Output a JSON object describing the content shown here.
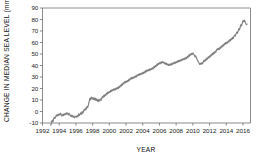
{
  "chart_data": {
    "type": "line",
    "title": "",
    "xlabel": "YEAR",
    "ylabel": "CHANGE IN MEDIAN  SEA LEVEL (mm)",
    "xlim": [
      1992,
      2016.9
    ],
    "ylim": [
      -10,
      90
    ],
    "xticks": [
      1992,
      1994,
      1996,
      1998,
      2000,
      2002,
      2004,
      2006,
      2008,
      2010,
      2012,
      2014,
      2016
    ],
    "xtick_labels": [
      "1992",
      "1994",
      "1996",
      "1998",
      "2000",
      "2002",
      "2004",
      "2006",
      "2008",
      "2010",
      "2012",
      "2014",
      "2016"
    ],
    "yticks": [
      -10,
      0,
      10,
      20,
      30,
      40,
      50,
      60,
      70,
      80,
      90
    ],
    "ytick_labels": [
      "-10",
      "0",
      "10",
      "20",
      "30",
      "40",
      "50",
      "60",
      "70",
      "80",
      "90"
    ],
    "grid": false,
    "legend": null,
    "line_color": "#7f7f7f",
    "series": [
      {
        "name": "Change in median sea level",
        "x": [
          1993.0,
          1993.08,
          1993.17,
          1993.25,
          1993.33,
          1993.42,
          1993.5,
          1993.58,
          1993.67,
          1993.75,
          1993.83,
          1993.92,
          1994.0,
          1994.08,
          1994.17,
          1994.25,
          1994.33,
          1994.42,
          1994.5,
          1994.58,
          1994.67,
          1994.75,
          1994.83,
          1994.92,
          1995.0,
          1995.08,
          1995.17,
          1995.25,
          1995.33,
          1995.42,
          1995.5,
          1995.58,
          1995.67,
          1995.75,
          1995.83,
          1995.92,
          1996.0,
          1996.08,
          1996.17,
          1996.25,
          1996.33,
          1996.42,
          1996.5,
          1996.58,
          1996.67,
          1996.75,
          1996.83,
          1996.92,
          1997.0,
          1997.08,
          1997.17,
          1997.25,
          1997.33,
          1997.42,
          1997.5,
          1997.58,
          1997.67,
          1997.75,
          1997.83,
          1997.92,
          1998.0,
          1998.08,
          1998.17,
          1998.25,
          1998.33,
          1998.42,
          1998.5,
          1998.58,
          1998.67,
          1998.75,
          1998.83,
          1998.92,
          1999.0,
          1999.08,
          1999.17,
          1999.25,
          1999.33,
          1999.42,
          1999.5,
          1999.58,
          1999.67,
          1999.75,
          1999.83,
          1999.92,
          2000.0,
          2000.08,
          2000.17,
          2000.25,
          2000.33,
          2000.42,
          2000.5,
          2000.58,
          2000.67,
          2000.75,
          2000.83,
          2000.92,
          2001.0,
          2001.08,
          2001.17,
          2001.25,
          2001.33,
          2001.42,
          2001.5,
          2001.58,
          2001.67,
          2001.75,
          2001.83,
          2001.92,
          2002.0,
          2002.08,
          2002.17,
          2002.25,
          2002.33,
          2002.42,
          2002.5,
          2002.58,
          2002.67,
          2002.75,
          2002.83,
          2002.92,
          2003.0,
          2003.08,
          2003.17,
          2003.25,
          2003.33,
          2003.42,
          2003.5,
          2003.58,
          2003.67,
          2003.75,
          2003.83,
          2003.92,
          2004.0,
          2004.08,
          2004.17,
          2004.25,
          2004.33,
          2004.42,
          2004.5,
          2004.58,
          2004.67,
          2004.75,
          2004.83,
          2004.92,
          2005.0,
          2005.08,
          2005.17,
          2005.25,
          2005.33,
          2005.42,
          2005.5,
          2005.58,
          2005.67,
          2005.75,
          2005.83,
          2005.92,
          2006.0,
          2006.08,
          2006.17,
          2006.25,
          2006.33,
          2006.42,
          2006.5,
          2006.58,
          2006.67,
          2006.75,
          2006.83,
          2006.92,
          2007.0,
          2007.08,
          2007.17,
          2007.25,
          2007.33,
          2007.42,
          2007.5,
          2007.58,
          2007.67,
          2007.75,
          2007.83,
          2007.92,
          2008.0,
          2008.08,
          2008.17,
          2008.25,
          2008.33,
          2008.42,
          2008.5,
          2008.58,
          2008.67,
          2008.75,
          2008.83,
          2008.92,
          2009.0,
          2009.08,
          2009.17,
          2009.25,
          2009.33,
          2009.42,
          2009.5,
          2009.58,
          2009.67,
          2009.75,
          2009.83,
          2009.92,
          2010.0,
          2010.08,
          2010.17,
          2010.25,
          2010.33,
          2010.42,
          2010.5,
          2010.58,
          2010.67,
          2010.75,
          2010.83,
          2010.92,
          2011.0,
          2011.08,
          2011.17,
          2011.25,
          2011.33,
          2011.42,
          2011.5,
          2011.58,
          2011.67,
          2011.75,
          2011.83,
          2011.92,
          2012.0,
          2012.08,
          2012.17,
          2012.25,
          2012.33,
          2012.42,
          2012.5,
          2012.58,
          2012.67,
          2012.75,
          2012.83,
          2012.92,
          2013.0,
          2013.08,
          2013.17,
          2013.25,
          2013.33,
          2013.42,
          2013.5,
          2013.58,
          2013.67,
          2013.75,
          2013.83,
          2013.92,
          2014.0,
          2014.08,
          2014.17,
          2014.25,
          2014.33,
          2014.42,
          2014.5,
          2014.58,
          2014.67,
          2014.75,
          2014.83,
          2014.92,
          2015.0,
          2015.08,
          2015.17,
          2015.25,
          2015.33,
          2015.42,
          2015.5,
          2015.58,
          2015.67,
          2015.75,
          2015.83,
          2015.92,
          2016.0,
          2016.08,
          2016.17,
          2016.25,
          2016.33,
          2016.42,
          2016.5
        ],
        "y": [
          -12.0,
          -9.0,
          -7.5,
          -9.0,
          -6.5,
          -5.0,
          -6.0,
          -4.5,
          -3.0,
          -4.0,
          -2.5,
          -3.5,
          -2.0,
          -3.0,
          -1.5,
          -3.0,
          -4.0,
          -2.5,
          -3.5,
          -2.0,
          -3.0,
          -1.5,
          -2.5,
          -1.0,
          -2.0,
          -3.0,
          -1.5,
          -2.5,
          -4.0,
          -3.0,
          -4.5,
          -3.5,
          -5.0,
          -4.0,
          -5.5,
          -4.5,
          -4.0,
          -5.0,
          -3.5,
          -4.5,
          -2.0,
          -3.5,
          -2.5,
          -1.0,
          -2.5,
          0.0,
          -1.5,
          0.5,
          2.0,
          1.0,
          3.0,
          2.0,
          4.5,
          3.5,
          6.0,
          8.5,
          11.5,
          10.0,
          12.5,
          11.0,
          12.0,
          10.5,
          12.0,
          10.0,
          11.5,
          9.5,
          11.0,
          9.0,
          10.5,
          8.5,
          10.0,
          11.0,
          9.5,
          11.0,
          13.0,
          12.0,
          14.0,
          13.0,
          15.0,
          14.0,
          16.0,
          15.0,
          17.0,
          16.0,
          17.5,
          16.5,
          18.5,
          17.5,
          19.0,
          18.0,
          19.5,
          18.5,
          20.0,
          19.0,
          20.5,
          19.5,
          21.0,
          20.0,
          22.0,
          21.0,
          23.0,
          22.0,
          24.0,
          23.0,
          25.0,
          24.0,
          26.0,
          25.0,
          26.5,
          25.5,
          27.0,
          26.0,
          28.0,
          27.0,
          29.0,
          28.0,
          29.5,
          28.5,
          30.0,
          29.0,
          30.5,
          29.5,
          31.0,
          30.0,
          32.0,
          31.0,
          32.5,
          31.5,
          33.0,
          32.0,
          33.5,
          32.5,
          34.0,
          33.0,
          34.5,
          33.5,
          35.5,
          34.5,
          36.0,
          35.0,
          36.5,
          35.5,
          37.0,
          36.0,
          37.5,
          36.5,
          38.0,
          37.0,
          39.0,
          38.0,
          40.0,
          39.0,
          41.0,
          40.0,
          42.0,
          41.0,
          42.5,
          41.5,
          43.0,
          42.0,
          43.5,
          42.5,
          43.0,
          41.5,
          42.5,
          41.0,
          42.0,
          40.5,
          41.5,
          40.0,
          41.0,
          40.0,
          41.5,
          40.5,
          42.0,
          41.0,
          42.5,
          41.5,
          43.0,
          42.0,
          43.5,
          42.5,
          44.0,
          43.0,
          44.5,
          43.5,
          45.0,
          44.0,
          45.5,
          44.5,
          46.0,
          45.0,
          46.5,
          45.5,
          47.0,
          46.0,
          48.0,
          47.0,
          49.0,
          48.0,
          50.0,
          49.0,
          50.5,
          49.5,
          51.0,
          50.0,
          49.0,
          47.5,
          48.5,
          47.0,
          45.5,
          44.0,
          43.0,
          42.0,
          41.0,
          42.0,
          41.0,
          42.5,
          41.5,
          43.0,
          44.5,
          43.5,
          45.5,
          44.5,
          46.5,
          45.5,
          47.5,
          46.5,
          48.5,
          47.5,
          49.5,
          48.5,
          50.5,
          49.5,
          51.5,
          50.5,
          52.5,
          51.5,
          53.5,
          54.5,
          53.5,
          55.0,
          54.0,
          56.0,
          55.0,
          57.0,
          56.0,
          58.0,
          57.0,
          59.0,
          58.0,
          60.0,
          59.0,
          60.5,
          59.5,
          61.5,
          60.5,
          62.5,
          61.5,
          63.5,
          62.5,
          64.5,
          63.5,
          65.5,
          66.5,
          65.5,
          67.5,
          69.0,
          68.0,
          70.0,
          72.0,
          71.0,
          73.5,
          75.5,
          74.5,
          77.0,
          79.0,
          78.0,
          79.5,
          78.0,
          76.5,
          75.5,
          76.0
        ]
      }
    ]
  }
}
